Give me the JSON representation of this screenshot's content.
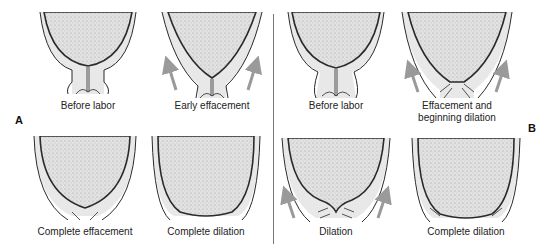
{
  "figure": {
    "divider": true,
    "colors": {
      "head_fill": "#d9d9d9",
      "tissue_fill": "#e6e6e6",
      "outline": "#2a2a2a",
      "arrow": "#9a9a9a",
      "text": "#222222"
    },
    "panels": [
      {
        "letter": "A",
        "stages": [
          {
            "label": "Before labor",
            "arrows": false
          },
          {
            "label": "Early effacement",
            "arrows": true
          },
          {
            "label": "Complete effacement",
            "arrows": false
          },
          {
            "label": "Complete dilation",
            "arrows": false
          }
        ]
      },
      {
        "letter": "B",
        "stages": [
          {
            "label": "Before labor",
            "arrows": false
          },
          {
            "label": "Effacement and",
            "label_line2": "beginning dilation",
            "arrows": true
          },
          {
            "label": "Dilation",
            "arrows": true
          },
          {
            "label": "Complete dilation",
            "arrows": false
          }
        ]
      }
    ]
  }
}
